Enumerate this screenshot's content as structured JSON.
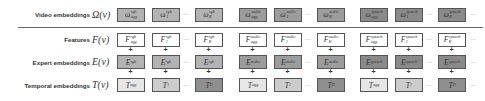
{
  "rows": [
    {
      "label": "Video embeddings",
      "symbol": "Ω(v)",
      "base": "ω",
      "kind": "omega"
    },
    {
      "label": "Features",
      "symbol": "F(v)",
      "base": "F",
      "kind": "feature"
    },
    {
      "label": "Expert embeddings",
      "symbol": "E(v)",
      "base": "E",
      "kind": "expert"
    },
    {
      "label": "Temporal embeddings",
      "symbol": "T(v)",
      "base": "T",
      "kind": "temporal"
    }
  ],
  "modalities": [
    {
      "name": "rgb",
      "indices": [
        "agg",
        "1",
        "K"
      ],
      "temporal": [
        "agg",
        "1",
        "D"
      ]
    },
    {
      "name": "audio",
      "indices": [
        "agg",
        "1",
        "K"
      ],
      "temporal": [
        "agg",
        "1",
        "D"
      ]
    },
    {
      "name": "speech",
      "indices": [
        "agg",
        "1",
        "K"
      ],
      "temporal": [
        "agg",
        "1",
        "D"
      ]
    }
  ],
  "ellipsis": "···",
  "plus": "+",
  "colors": {
    "omega_rgb": "#b3b3b3",
    "omega_audio": "#9c9c9c",
    "omega_speech": "#8a8a8a",
    "feature": "#ffffff",
    "expert_rgb": "#b3b3b3",
    "expert_audio": "#9c9c9c",
    "expert_speech": "#8a8a8a",
    "temporal_agg": "#e6e6e6",
    "temporal_1": "#cccccc",
    "temporal_D": "#8f8f8f"
  }
}
